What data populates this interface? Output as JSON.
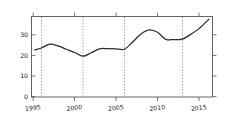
{
  "chart_data": {
    "type": "line",
    "title": "",
    "subtitle": "",
    "xlabel": "",
    "ylabel": "",
    "xlim": [
      1994.7,
      2016.6
    ],
    "ylim": [
      0,
      39
    ],
    "grid": false,
    "legend": null,
    "y_ticks": [
      0,
      10,
      20,
      30
    ],
    "y_tick_labels": [
      "0",
      "10",
      "20",
      "30"
    ],
    "x_ticks": [
      1995,
      2000,
      2005,
      2010,
      2015
    ],
    "x_tick_labels": [
      "1995",
      "2000",
      "2005",
      "2010",
      "2015"
    ],
    "annotations": [
      {
        "type": "vertical-dotted-line",
        "x": 1996,
        "label": ""
      },
      {
        "type": "vertical-dotted-line",
        "x": 2001,
        "label": ""
      },
      {
        "type": "vertical-dotted-line",
        "x": 2006,
        "label": ""
      },
      {
        "type": "vertical-dotted-line",
        "x": 2013,
        "label": ""
      }
    ],
    "series": [
      {
        "name": "",
        "color": "#2b2b2b",
        "x": [
          1995.2,
          1996,
          1997,
          1998,
          1999,
          2000,
          2001,
          2002,
          2003,
          2004,
          2005,
          2006,
          2007,
          2008,
          2009,
          2010,
          2011,
          2012,
          2013,
          2014,
          2015,
          2016.2
        ],
        "values": [
          22.6,
          23.6,
          25.5,
          24.6,
          23.0,
          21.4,
          19.6,
          21.3,
          23.2,
          23.3,
          23.2,
          23.0,
          26.5,
          30.4,
          32.4,
          31.2,
          27.8,
          27.7,
          27.9,
          30.2,
          33.0,
          37.6
        ]
      }
    ]
  }
}
